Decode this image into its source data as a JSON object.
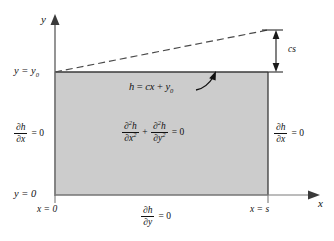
{
  "figure": {
    "type": "diagram",
    "colors": {
      "fill": "#cccccc",
      "stroke": "#4a4a4a",
      "ink": "#111111",
      "background": "#ffffff"
    },
    "domain_rect": {
      "x0": 55,
      "y0_top": 72,
      "x1": 268,
      "y1_bottom": 195
    }
  },
  "axes": {
    "y_axis_label": "y",
    "x_axis_label": "x"
  },
  "labels": {
    "y_top": "y = y",
    "y_top_sub": "0",
    "y_bottom": "y = 0",
    "x_left": "x = 0",
    "x_right": "x = s",
    "cs": "cs"
  },
  "annotations": {
    "water_table": {
      "head": "h",
      "eq": "=",
      "slope": "cx",
      "plus": "+",
      "intercept": "y",
      "intercept_sub": "0",
      "full": "h = cx + y0"
    }
  },
  "equations": {
    "governing": {
      "term1_num": "∂",
      "term1_num_exp": "2",
      "term1_num_var": "h",
      "term1_den": "∂x",
      "term1_den_exp": "2",
      "operator": "+",
      "term2_num": "∂",
      "term2_num_exp": "2",
      "term2_num_var": "h",
      "term2_den": "∂y",
      "term2_den_exp": "2",
      "rhs": "= 0",
      "full": "∂2h/∂x2 + ∂2h/∂y2 = 0"
    },
    "bc_left": {
      "num": "∂h",
      "den": "∂x",
      "rhs": "= 0",
      "full": "∂h/∂x = 0"
    },
    "bc_right": {
      "num": "∂h",
      "den": "∂x",
      "rhs": "= 0",
      "full": "∂h/∂x = 0"
    },
    "bc_bottom": {
      "num": "∂h",
      "den": "∂y",
      "rhs": "= 0",
      "full": "∂h/∂y = 0"
    }
  }
}
